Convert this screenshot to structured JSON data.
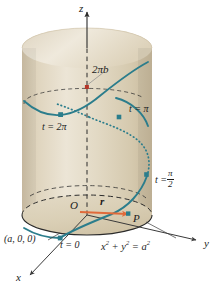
{
  "axes": {
    "x_label": "x",
    "y_label": "y",
    "z_label": "z",
    "origin_label": "O"
  },
  "labels": {
    "pitch": "2πb",
    "t_zero": "t = 0",
    "t_half_pi_prefix": "t =",
    "t_half_pi_numerator": "π",
    "t_half_pi_denominator": "2",
    "t_pi": "t = π",
    "t_two_pi": "t = 2π",
    "point_p": "P",
    "vector_r": "r",
    "base_point": "(a, 0, 0)",
    "cylinder_equation_x": "x",
    "cylinder_equation_sup1": "2",
    "cylinder_equation_plus": "+ y",
    "cylinder_equation_sup2": "2",
    "cylinder_equation_eq": "= a",
    "cylinder_equation_sup3": "2"
  },
  "colors": {
    "cylinder_fill": "#ddd2ba",
    "cylinder_fill_light": "#ebe3d2",
    "cylinder_fill_dark": "#cdbfa3",
    "cylinder_top": "#e8e0ce",
    "helix": "#2b7d8c",
    "helix_marker": "#2b7d8c",
    "vector_arrow": "#e06a3a",
    "pitch_marker": "#b5372a",
    "outline": "#2b2b2b",
    "axis": "#2b2b2b",
    "background": "#ffffff"
  },
  "geometry": {
    "cylinder_radius_px": 65,
    "cylinder_left_px": 22,
    "cylinder_right_px": 152,
    "cylinder_top_y_px": 30,
    "cylinder_bottom_y_px": 215,
    "ellipse_ry_px": 20,
    "center_x_px": 87
  }
}
